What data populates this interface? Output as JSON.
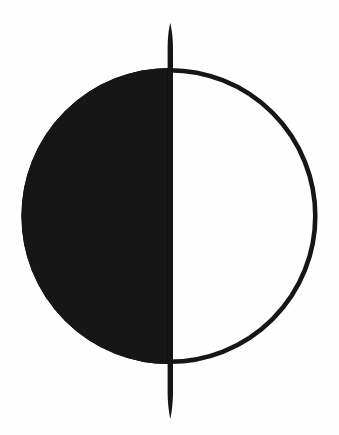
{
  "symbol": {
    "name": "first-quarter-moon-icon",
    "description": "circle with solid left half, outlined right half, vertical line through center",
    "ink_color": "#151313",
    "background_color": "#fefefe"
  }
}
